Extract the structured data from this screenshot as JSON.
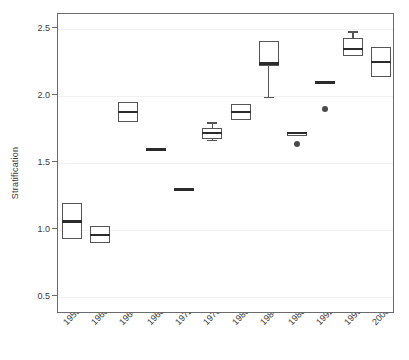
{
  "figure": {
    "background_color": "#ffffff",
    "frame_color": "#6b6b6b",
    "box_edge_color": "#555555",
    "median_color": "#2b2b2b",
    "outlier_color": "#4a4a4a",
    "gridline_color": "#f0f0f0"
  },
  "chart_data": {
    "type": "box",
    "title": "",
    "subtitle": "",
    "xlabel": "",
    "ylabel": "Stratification",
    "ylim": [
      0.37,
      2.61
    ],
    "yticks": [
      0.5,
      1.0,
      1.5,
      2.0,
      2.5
    ],
    "ytick_labels": [
      "0.5",
      "1.0",
      "1.5",
      "2.0",
      "2.5"
    ],
    "grid": true,
    "legend": null,
    "categories": [
      "1956",
      "1960",
      "1964",
      "1968",
      "1972",
      "1976",
      "1980",
      "1984",
      "1988",
      "1992",
      "1996",
      "2000"
    ],
    "boxes": [
      {
        "category": "1956",
        "q1": 0.93,
        "median": 1.06,
        "q3": 1.2,
        "whisker_low": 0.93,
        "whisker_high": 1.2,
        "outliers": []
      },
      {
        "category": "1960",
        "q1": 0.9,
        "median": 0.96,
        "q3": 1.03,
        "whisker_low": 0.9,
        "whisker_high": 1.03,
        "outliers": []
      },
      {
        "category": "1964",
        "q1": 1.8,
        "median": 1.88,
        "q3": 1.95,
        "whisker_low": 1.8,
        "whisker_high": 1.95,
        "outliers": []
      },
      {
        "category": "1968",
        "q1": 1.6,
        "median": 1.6,
        "q3": 1.6,
        "whisker_low": 1.6,
        "whisker_high": 1.6,
        "outliers": []
      },
      {
        "category": "1972",
        "q1": 1.29,
        "median": 1.3,
        "q3": 1.31,
        "whisker_low": 1.29,
        "whisker_high": 1.31,
        "outliers": []
      },
      {
        "category": "1976",
        "q1": 1.68,
        "median": 1.72,
        "q3": 1.76,
        "whisker_low": 1.67,
        "whisker_high": 1.8,
        "outliers": []
      },
      {
        "category": "1980",
        "q1": 1.82,
        "median": 1.88,
        "q3": 1.94,
        "whisker_low": 1.82,
        "whisker_high": 1.94,
        "outliers": []
      },
      {
        "category": "1984",
        "q1": 2.22,
        "median": 2.24,
        "q3": 2.41,
        "whisker_low": 1.99,
        "whisker_high": 2.41,
        "outliers": []
      },
      {
        "category": "1988",
        "q1": 1.7,
        "median": 1.72,
        "q3": 1.73,
        "whisker_low": 1.7,
        "whisker_high": 1.73,
        "outliers": [
          1.64
        ]
      },
      {
        "category": "1992",
        "q1": 2.1,
        "median": 2.1,
        "q3": 2.11,
        "whisker_low": 2.1,
        "whisker_high": 2.11,
        "outliers": [
          1.9
        ]
      },
      {
        "category": "1996",
        "q1": 2.3,
        "median": 2.35,
        "q3": 2.43,
        "whisker_low": 2.3,
        "whisker_high": 2.48,
        "outliers": []
      },
      {
        "category": "2000",
        "q1": 2.14,
        "median": 2.25,
        "q3": 2.36,
        "whisker_low": 2.14,
        "whisker_high": 2.36,
        "outliers": []
      }
    ]
  }
}
